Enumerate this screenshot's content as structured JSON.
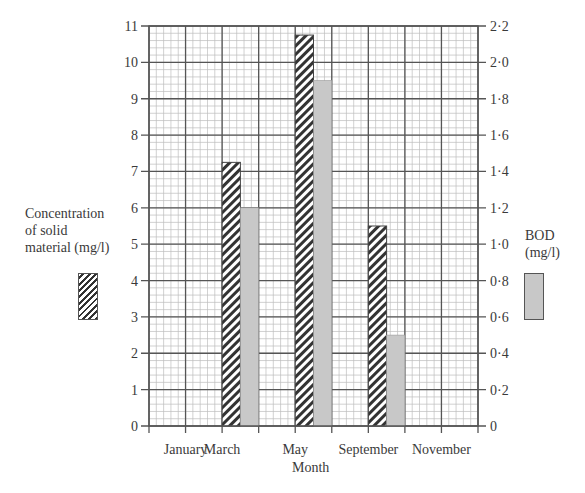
{
  "chart_data": {
    "type": "bar",
    "title": "",
    "xlabel": "Month",
    "categories": [
      "January",
      "March",
      "May",
      "September",
      "November"
    ],
    "series": [
      {
        "name": "Concentration of solid material (mg/l)",
        "axis": "left",
        "pattern": "hatched",
        "values": [
          null,
          7.25,
          10.75,
          5.5,
          null
        ]
      },
      {
        "name": "BOD (mg/l)",
        "axis": "right",
        "pattern": "grey",
        "values": [
          null,
          1.2,
          1.9,
          0.5,
          null
        ]
      }
    ],
    "left_axis": {
      "label": "Concentration of solid material (mg/l)",
      "ylim": [
        0,
        11
      ],
      "ticks": [
        "0",
        "1",
        "2",
        "3",
        "4",
        "5",
        "6",
        "7",
        "8",
        "9",
        "10",
        "11"
      ]
    },
    "right_axis": {
      "label": "BOD (mg/l)",
      "ylim": [
        0,
        2.2
      ],
      "ticks": [
        "0",
        "0·2",
        "0·4",
        "0·6",
        "0·8",
        "1·0",
        "1·2",
        "1·4",
        "1·6",
        "1·8",
        "2·0",
        "2·2"
      ]
    },
    "grid": true,
    "legend_position": "sides"
  },
  "labels": {
    "left_axis_line1": "Concentration",
    "left_axis_line2": "of solid",
    "left_axis_line3": "material (mg/l)",
    "right_axis_line1": "BOD",
    "right_axis_line2": "(mg/l)",
    "xlabel": "Month"
  },
  "colors": {
    "grey_bar": "#c8c8c8",
    "grid_major": "#555555",
    "grid_minor": "#bdbdbd",
    "border": "#555555"
  }
}
